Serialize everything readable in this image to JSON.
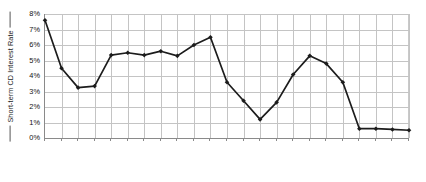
{
  "chart_data": {
    "type": "line",
    "title": "",
    "subtitle": "",
    "xlabel": "",
    "ylabel": "Short-term CD Interest Rate",
    "ylim": [
      0,
      8
    ],
    "ytick_labels": [
      "0%",
      "1%",
      "2%",
      "3%",
      "4%",
      "5%",
      "6%",
      "7%",
      "8%"
    ],
    "ytick_values": [
      0,
      1,
      2,
      3,
      4,
      5,
      6,
      7,
      8
    ],
    "grid": true,
    "legend": "none",
    "annotations": [],
    "categories": [
      "1990",
      "1991",
      "1992",
      "1993",
      "1994",
      "1995",
      "1996",
      "1997",
      "1998",
      "1999",
      "2000",
      "2001",
      "2002",
      "2003",
      "2004",
      "2005",
      "2006",
      "2007",
      "2008",
      "2009",
      "2010",
      "2011",
      "2012"
    ],
    "values": [
      7.6,
      4.5,
      3.25,
      3.35,
      5.35,
      5.5,
      5.35,
      5.6,
      5.3,
      6.0,
      6.5,
      3.6,
      2.4,
      1.2,
      2.3,
      4.1,
      5.3,
      4.8,
      3.6,
      0.6,
      0.6,
      0.55,
      0.5
    ],
    "series": [
      {
        "name": "Short-term CD Interest Rate",
        "color": "#1c1c1c",
        "marker": "diamond",
        "values": [
          7.6,
          4.5,
          3.25,
          3.35,
          5.35,
          5.5,
          5.35,
          5.6,
          5.3,
          6.0,
          6.5,
          3.6,
          2.4,
          1.2,
          2.3,
          4.1,
          5.3,
          4.8,
          3.6,
          0.6,
          0.6,
          0.55,
          0.5
        ]
      }
    ],
    "colors": {
      "line": "#1c1c1c",
      "marker": "#1c1c1c",
      "grid": "#c4c4c4",
      "axis": "#8a8a8a",
      "background": "#ffffff",
      "text": "#111111"
    }
  }
}
